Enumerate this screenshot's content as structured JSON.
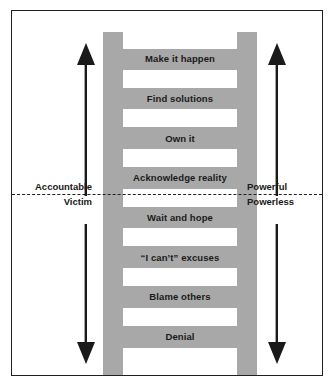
{
  "diagram": {
    "colors": {
      "ladder_fill": "#a8a8a8",
      "frame_border": "#231f20",
      "text": "#1a1a1a",
      "background": "#ffffff"
    },
    "steps": [
      {
        "label": "Make it happen",
        "zone": "accountable"
      },
      {
        "label": "Find solutions",
        "zone": "accountable"
      },
      {
        "label": "Own it",
        "zone": "accountable"
      },
      {
        "label": "Acknowledge reality",
        "zone": "accountable"
      },
      {
        "label": "Wait and hope",
        "zone": "victim"
      },
      {
        "label": "“I can’t” excuses",
        "zone": "victim"
      },
      {
        "label": "Blame others",
        "zone": "victim"
      },
      {
        "label": "Denial",
        "zone": "victim"
      }
    ],
    "divider": {
      "style": "dashed",
      "left_above": "Accountable",
      "left_below": "Victim",
      "right_above": "Powerful",
      "right_below": "Powerless"
    },
    "arrows": [
      {
        "name": "left-up",
        "direction": "up",
        "side": "left"
      },
      {
        "name": "left-down",
        "direction": "down",
        "side": "left"
      },
      {
        "name": "right-up",
        "direction": "up",
        "side": "right"
      },
      {
        "name": "right-down",
        "direction": "down",
        "side": "right"
      }
    ]
  }
}
